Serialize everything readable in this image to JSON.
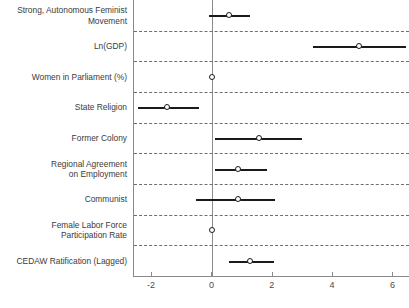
{
  "chart_data": {
    "type": "scatter",
    "title": "",
    "subtitle": "",
    "xlabel": "",
    "ylabel": "",
    "xlim": [
      -2.6,
      6.55
    ],
    "xticks": [
      -2,
      0,
      2,
      4,
      6
    ],
    "xtick_labels": [
      "-2",
      "0",
      "2",
      "4",
      "6"
    ],
    "grid": false,
    "row_separators": true,
    "zero_reference_line": 0,
    "legend": null,
    "orientation": "horizontal",
    "point_estimate_label": "coefficient",
    "interval_label": "confidence interval",
    "categories": [
      "Strong, Autonomous Feminist\nMovement",
      "Ln(GDP)",
      "Women in Parliament (%)",
      "State Religion",
      "Former Colony",
      "Regional Agreement\non Employment",
      "Communist",
      "Female Labor Force\nParticipation Rate",
      "CEDAW Ratification (Lagged)"
    ],
    "values": [
      0.56,
      4.85,
      0.0,
      -1.49,
      1.55,
      0.86,
      0.86,
      0.0,
      1.25
    ],
    "ci_low": [
      -0.1,
      3.33,
      -0.02,
      -2.48,
      0.07,
      0.1,
      -0.53,
      -0.02,
      0.56
    ],
    "ci_high": [
      1.25,
      6.43,
      0.03,
      -0.46,
      2.97,
      1.82,
      2.08,
      0.03,
      2.05
    ],
    "series": [
      {
        "name": "coefficient",
        "points": [
          {
            "category": "Strong, Autonomous Feminist Movement",
            "estimate": 0.56,
            "low": -0.1,
            "high": 1.25
          },
          {
            "category": "Ln(GDP)",
            "estimate": 4.85,
            "low": 3.33,
            "high": 6.43
          },
          {
            "category": "Women in Parliament (%)",
            "estimate": 0.0,
            "low": -0.02,
            "high": 0.03
          },
          {
            "category": "State Religion",
            "estimate": -1.49,
            "low": -2.48,
            "high": -0.46
          },
          {
            "category": "Former Colony",
            "estimate": 1.55,
            "low": 0.07,
            "high": 2.97
          },
          {
            "category": "Regional Agreement on Employment",
            "estimate": 0.86,
            "low": 0.1,
            "high": 1.82
          },
          {
            "category": "Communist",
            "estimate": 0.86,
            "low": -0.53,
            "high": 2.08
          },
          {
            "category": "Female Labor Force Participation Rate",
            "estimate": 0.0,
            "low": -0.02,
            "high": 0.03
          },
          {
            "category": "CEDAW Ratification (Lagged)",
            "estimate": 1.25,
            "low": 0.56,
            "high": 2.05
          }
        ]
      }
    ],
    "colors": {
      "marker_edge": "#1a1a1a",
      "marker_fill": "#ffffff",
      "interval": "#1a1a1a",
      "separator": "#6f6f6f",
      "axis": "#8a8a8a",
      "zero_line": "#8c8c8c",
      "text": "#3b3b3b"
    }
  }
}
